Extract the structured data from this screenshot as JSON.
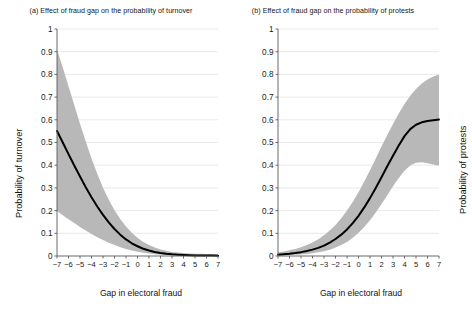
{
  "figure": {
    "width": 444,
    "height": 324,
    "background": "#ffffff"
  },
  "chart_data": [
    {
      "id": "panel-a",
      "type": "line",
      "title": "(a) Effect of fraud gap on the probability of turnover",
      "xlabel": "Gap in electoral fraud",
      "ylabel": "Probability of turnover",
      "xlim": [
        -7,
        7
      ],
      "ylim": [
        0,
        1
      ],
      "xticks": [
        "-7",
        "-6",
        "-5",
        "-4",
        "-3",
        "-2",
        "-1",
        "0",
        "1",
        "2",
        "3",
        "4",
        "5",
        "6",
        "7"
      ],
      "yticks": [
        "0",
        "0.1",
        "0.2",
        "0.3",
        "0.4",
        "0.5",
        "0.6",
        "0.7",
        "0.8",
        "0.9",
        "1"
      ],
      "grid": "horizontal",
      "legend": "none",
      "line_color": "#000000",
      "band_color": "#b8b8b8",
      "x": [
        -7,
        -6.5,
        -6,
        -5.5,
        -5,
        -4.5,
        -4,
        -3.5,
        -3,
        -2.5,
        -2,
        -1.5,
        -1,
        -0.5,
        0,
        0.5,
        1,
        1.5,
        2,
        2.5,
        3,
        3.5,
        4,
        4.5,
        5,
        5.5,
        6,
        6.5,
        7
      ],
      "series": [
        {
          "name": "Predicted probability",
          "values": [
            0.551,
            0.5,
            0.449,
            0.399,
            0.35,
            0.303,
            0.259,
            0.218,
            0.181,
            0.148,
            0.119,
            0.094,
            0.073,
            0.056,
            0.043,
            0.032,
            0.024,
            0.018,
            0.013,
            0.0098,
            0.0073,
            0.0055,
            0.0041,
            0.0032,
            0.0026,
            0.0022,
            0.0019,
            0.0017,
            0.0016
          ]
        },
        {
          "name": "95% CI upper",
          "values": [
            0.91,
            0.83,
            0.748,
            0.665,
            0.583,
            0.504,
            0.43,
            0.362,
            0.301,
            0.248,
            0.202,
            0.163,
            0.13,
            0.102,
            0.08,
            0.062,
            0.048,
            0.037,
            0.029,
            0.023,
            0.018,
            0.015,
            0.013,
            0.011,
            0.01,
            0.0095,
            0.009,
            0.0087,
            0.0085
          ]
        },
        {
          "name": "95% CI lower",
          "values": [
            0.198,
            0.18,
            0.162,
            0.145,
            0.128,
            0.112,
            0.097,
            0.083,
            0.07,
            0.058,
            0.048,
            0.039,
            0.031,
            0.024,
            0.0185,
            0.014,
            0.0105,
            0.0078,
            0.0057,
            0.0042,
            0.003,
            0.0022,
            0.0016,
            0.0012,
            0.0009,
            0.0007,
            0.0005,
            0.0004,
            0.0003
          ]
        }
      ]
    },
    {
      "id": "panel-b",
      "type": "line",
      "title": "(b) Effect of fraud gap on the probability of protests",
      "xlabel": "Gap in electoral fraud",
      "ylabel": "Probability of protests",
      "xlim": [
        -7,
        7
      ],
      "ylim": [
        0,
        1
      ],
      "xticks": [
        "-7",
        "-6",
        "-5",
        "-4",
        "-3",
        "-2",
        "-1",
        "0",
        "1",
        "2",
        "3",
        "4",
        "5",
        "6",
        "7"
      ],
      "yticks": [
        "0",
        "0.1",
        "0.2",
        "0.3",
        "0.4",
        "0.5",
        "0.6",
        "0.7",
        "0.8",
        "0.9",
        "1"
      ],
      "grid": "horizontal",
      "legend": "none",
      "line_color": "#000000",
      "band_color": "#b8b8b8",
      "x": [
        -7,
        -6.5,
        -6,
        -5.5,
        -5,
        -4.5,
        -4,
        -3.5,
        -3,
        -2.5,
        -2,
        -1.5,
        -1,
        -0.5,
        0,
        0.5,
        1,
        1.5,
        2,
        2.5,
        3,
        3.5,
        4,
        4.5,
        5,
        5.5,
        6,
        6.5,
        7
      ],
      "series": [
        {
          "name": "Predicted probability",
          "values": [
            0.006,
            0.008,
            0.01,
            0.013,
            0.017,
            0.022,
            0.028,
            0.036,
            0.046,
            0.059,
            0.075,
            0.094,
            0.117,
            0.145,
            0.177,
            0.214,
            0.255,
            0.3,
            0.347,
            0.395,
            0.442,
            0.487,
            0.528,
            0.559,
            0.578,
            0.589,
            0.595,
            0.598,
            0.601
          ]
        },
        {
          "name": "95% CI upper",
          "values": [
            0.016,
            0.02,
            0.025,
            0.031,
            0.039,
            0.048,
            0.06,
            0.074,
            0.091,
            0.112,
            0.137,
            0.166,
            0.2,
            0.238,
            0.281,
            0.328,
            0.378,
            0.43,
            0.482,
            0.533,
            0.582,
            0.628,
            0.67,
            0.706,
            0.736,
            0.76,
            0.778,
            0.791,
            0.8
          ]
        },
        {
          "name": "95% CI lower",
          "values": [
            0.002,
            0.003,
            0.004,
            0.005,
            0.007,
            0.009,
            0.012,
            0.016,
            0.021,
            0.028,
            0.037,
            0.048,
            0.062,
            0.08,
            0.102,
            0.128,
            0.158,
            0.192,
            0.229,
            0.268,
            0.307,
            0.344,
            0.376,
            0.399,
            0.411,
            0.413,
            0.409,
            0.403,
            0.398
          ]
        }
      ]
    }
  ]
}
